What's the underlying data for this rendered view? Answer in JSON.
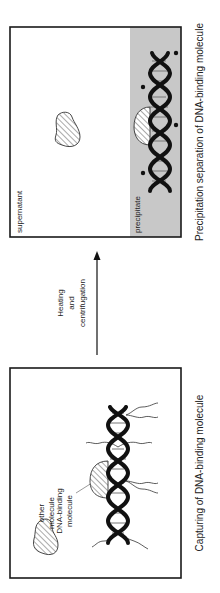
{
  "figure": {
    "panels": [
      {
        "id": "capturing",
        "caption": "Capturing of DNA-binding molecule",
        "labels": {
          "other_molecule_line1": "other",
          "other_molecule_line2": "molecule",
          "dna_binding_line1": "DNA-binding",
          "dna_binding_line2": "molecule"
        }
      },
      {
        "id": "precipitation",
        "caption": "Precipitation separation of DNA-binding molecule",
        "labels": {
          "supernatant": "supernatant",
          "precipitate": "precipitate"
        }
      }
    ],
    "arrow": {
      "line1": "Heating",
      "line2": "and",
      "line3": "centrifugation"
    },
    "colors": {
      "precipitate_fill": "#c8c8c8",
      "outline": "#1a1a1a"
    }
  }
}
